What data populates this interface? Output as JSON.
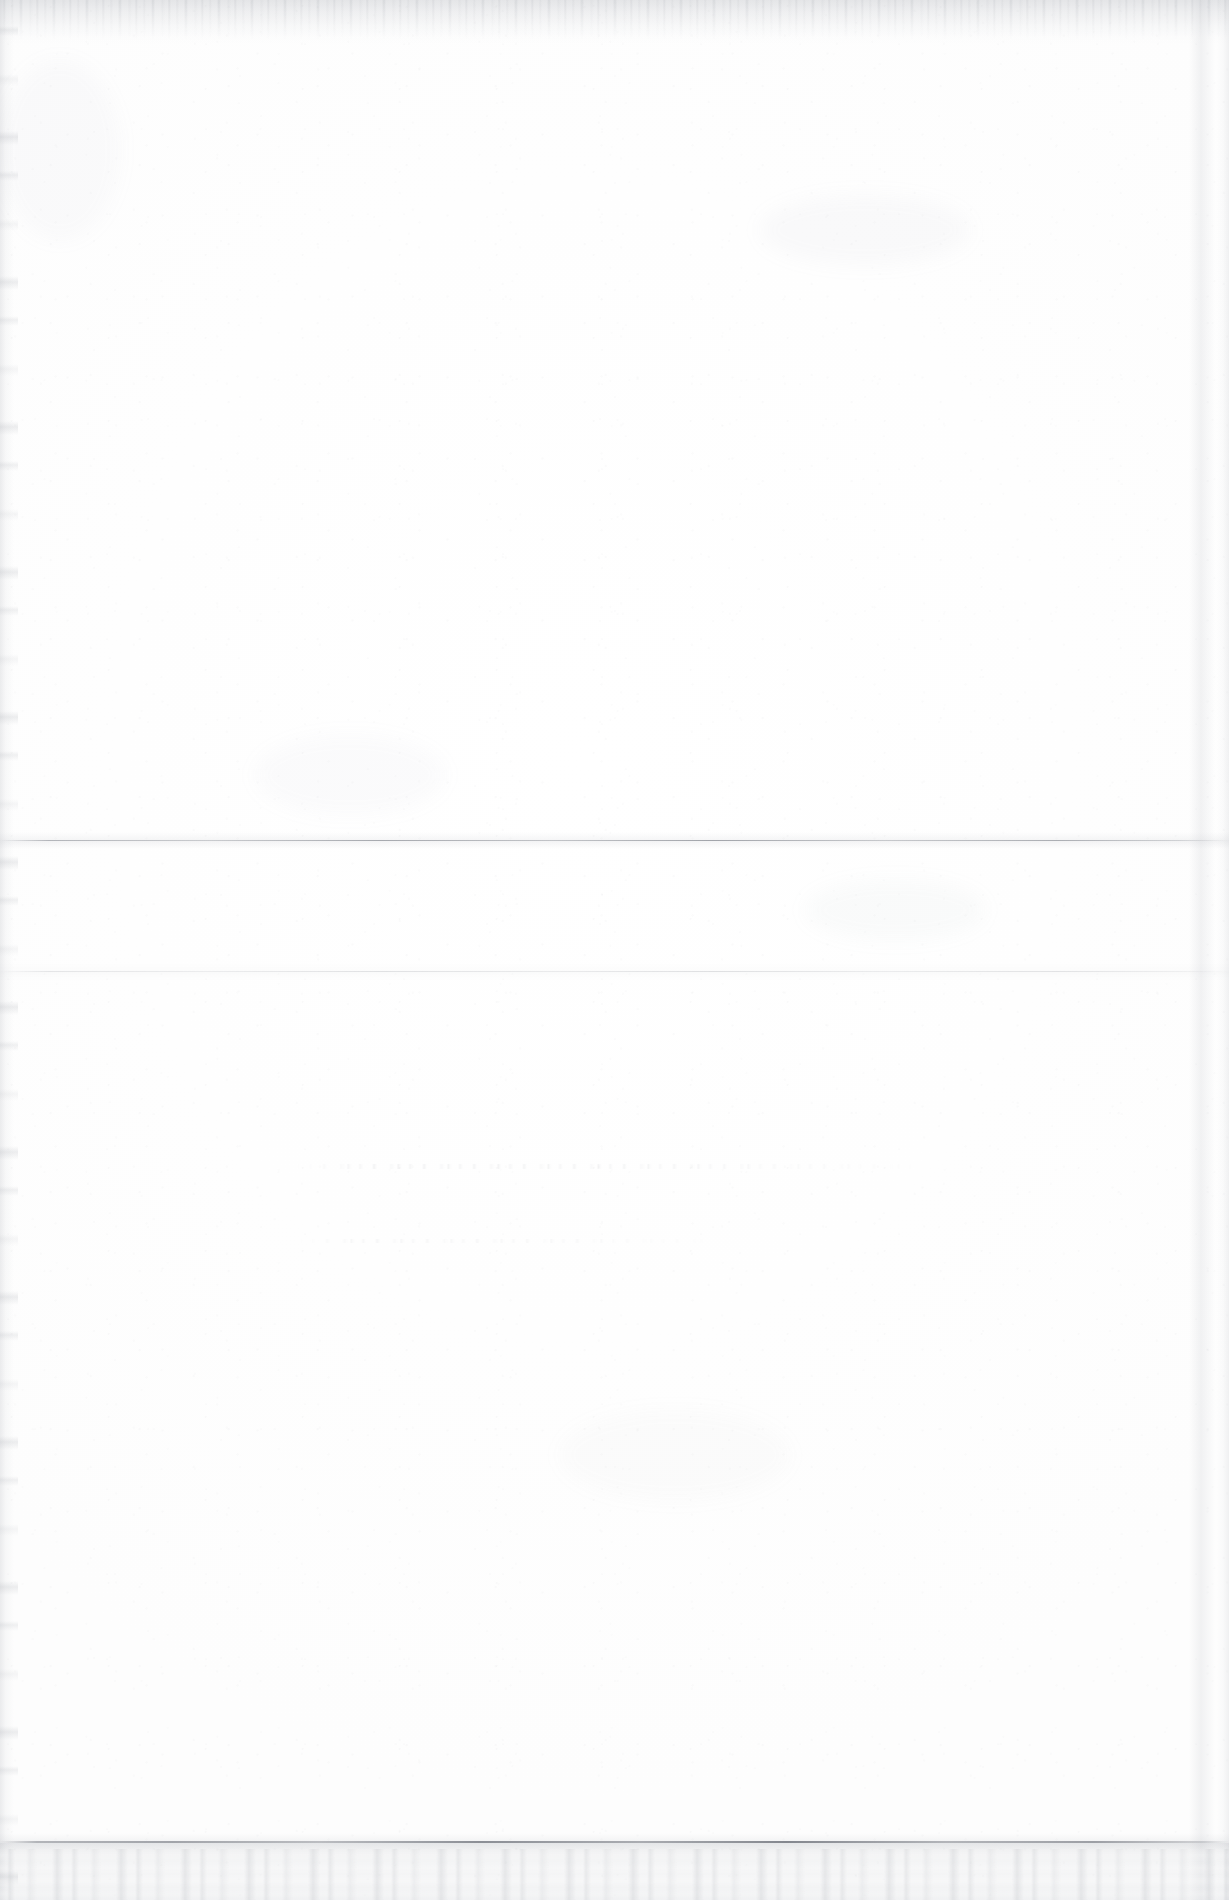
{
  "document": {
    "kind": "scanned-page",
    "page_side": "blank-verso",
    "visible_text": "",
    "text_lines": [],
    "headings": [],
    "page_number": "",
    "caption": "",
    "annotations": [],
    "notes": "No legible printed or handwritten text is present in the scan."
  },
  "canvas": {
    "width_px": 1229,
    "height_px": 1900,
    "background_color": "#ffffff",
    "paper_color": "#fdfdfd"
  },
  "artifacts": {
    "top_edge": {
      "name": "deckled-top-edge",
      "top_px": 0,
      "height_px": 44,
      "color": "#aaadb4"
    },
    "left_edge": {
      "name": "worn-left-edge",
      "left_px": 0,
      "width_px": 18,
      "color": "#a8abb2"
    },
    "right_edge": {
      "name": "right-edge-shadow",
      "right_px": 0,
      "width_px": 26,
      "color": "#b0b3ba"
    },
    "creases": [
      {
        "name": "mid-fold-crease",
        "top_px": 840,
        "color": "#787c84",
        "strength": "medium"
      },
      {
        "name": "secondary-fold-crease",
        "top_px": 971,
        "color": "#787c84",
        "strength": "faint"
      },
      {
        "name": "lower-fold-crease",
        "top_px": 1841,
        "color": "#686c75",
        "strength": "strong"
      }
    ],
    "bottom_flap": {
      "name": "bottom-fold-flap",
      "top_px": 1843,
      "height_px": 57,
      "color": "#b8bcc3"
    },
    "ghost_bands": [
      {
        "name": "bleed-through-band-upper",
        "left_px": 295,
        "top_px": 1164,
        "width_px": 640,
        "height_px": 5,
        "color": "#8e929b"
      },
      {
        "name": "bleed-through-band-lower",
        "left_px": 298,
        "top_px": 1239,
        "width_px": 430,
        "height_px": 4,
        "color": "#8e929b"
      }
    ],
    "smudges": [
      {
        "name": "smudge-upper-right",
        "left_px": 760,
        "top_px": 195,
        "color": "#a4a8b0"
      },
      {
        "name": "smudge-mid-right",
        "left_px": 805,
        "top_px": 880,
        "color": "#a4a8b0"
      },
      {
        "name": "smudge-mid-left",
        "left_px": 255,
        "top_px": 735,
        "color": "#a4a8b0"
      },
      {
        "name": "smudge-lower-mid",
        "left_px": 560,
        "top_px": 1410,
        "color": "#a4a8b0"
      },
      {
        "name": "smudge-top-left",
        "left_px": 0,
        "top_px": 60,
        "color": "#a4a8b0"
      }
    ]
  }
}
